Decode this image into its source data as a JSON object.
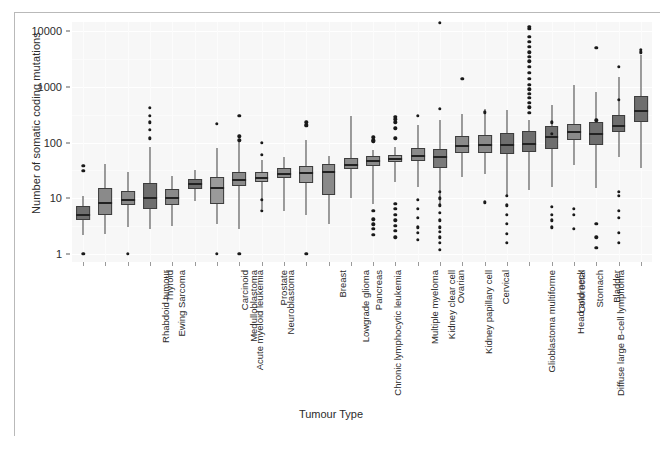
{
  "chart_data": {
    "type": "boxplot",
    "title": "",
    "xlabel": "Tumour Type",
    "ylabel": "Number of somatic coding mutations",
    "yscale": "log10",
    "ylim": [
      0.8,
      20000
    ],
    "yticks": [
      1,
      10,
      100,
      1000,
      10000
    ],
    "ytick_labels": [
      "1",
      "10",
      "100",
      "1000",
      "10000"
    ],
    "grid": true,
    "legend": "none",
    "categories": [
      "Rhabdoid tumour",
      "Ewing Sarcoma",
      "Thyroid",
      "Acute myeloid leukemia",
      "Medulloblastoma",
      "Carcinoid",
      "Neuroblastoma",
      "Prostate",
      "Chronic lymphocytic leukemia",
      "Lowgrade glioma",
      "Breast",
      "Pancreas",
      "Multiple myeloma",
      "Kidney clear cell",
      "Kidney papillary cell",
      "Ovarian",
      "Glioblastoma multiforme",
      "Cervical",
      "Diffuse large B-cell lymphoma",
      "Head and neck",
      "Colorectal",
      "Stomach",
      "Bladder",
      "Lung adenocarcinoma",
      "Lung squamous cell carcinoma",
      "Melanoma"
    ],
    "boxes": [
      {
        "category": "Rhabdoid tumour",
        "fill": "#6e6e6e",
        "lower_whisker": 2.2,
        "q1": 4.0,
        "median": 5.2,
        "q3": 7.2,
        "upper_whisker": 11.0,
        "outliers": [
          1.0,
          31,
          38
        ]
      },
      {
        "category": "Ewing Sarcoma",
        "fill": "#8a8a8a",
        "lower_whisker": 2.3,
        "q1": 5.0,
        "median": 8.5,
        "q3": 15.5,
        "upper_whisker": 41,
        "outliers": []
      },
      {
        "category": "Thyroid",
        "fill": "#8a8a8a",
        "lower_whisker": 3.0,
        "q1": 7.5,
        "median": 9.8,
        "q3": 13.5,
        "upper_whisker": 30,
        "outliers": [
          1.0
        ]
      },
      {
        "category": "Acute myeloid leukemia",
        "fill": "#6e6e6e",
        "lower_whisker": 2.8,
        "q1": 6.5,
        "median": 10.5,
        "q3": 18.5,
        "upper_whisker": 83,
        "outliers": [
          120,
          170,
          230,
          300,
          420
        ]
      },
      {
        "category": "Medulloblastoma",
        "fill": "#8a8a8a",
        "lower_whisker": 3.2,
        "q1": 7.5,
        "median": 10.5,
        "q3": 14.5,
        "upper_whisker": 25,
        "outliers": []
      },
      {
        "category": "Carcinoid",
        "fill": "#6e6e6e",
        "lower_whisker": 9.0,
        "q1": 14.5,
        "median": 18.5,
        "q3": 22.5,
        "upper_whisker": 32,
        "outliers": []
      },
      {
        "category": "Neuroblastoma",
        "fill": "#9a9a9a",
        "lower_whisker": 3.4,
        "q1": 8.0,
        "median": 16.0,
        "q3": 24.0,
        "upper_whisker": 80,
        "outliers": [
          1.0,
          220
        ]
      },
      {
        "category": "Prostate",
        "fill": "#8a8a8a",
        "lower_whisker": 2.8,
        "q1": 16.5,
        "median": 22.5,
        "q3": 30.0,
        "upper_whisker": 105,
        "outliers": [
          1.0,
          110,
          130,
          300
        ]
      },
      {
        "category": "Chronic lymphocytic leukemia",
        "fill": "#9a9a9a",
        "lower_whisker": 6.5,
        "q1": 19.5,
        "median": 24.5,
        "q3": 30.0,
        "upper_whisker": 48,
        "outliers": [
          6.0,
          9.5,
          60,
          100
        ]
      },
      {
        "category": "Lowgrade glioma",
        "fill": "#8a8a8a",
        "lower_whisker": 6.0,
        "q1": 23.0,
        "median": 28.5,
        "q3": 35.5,
        "upper_whisker": 55,
        "outliers": []
      },
      {
        "category": "Breast",
        "fill": "#9a9a9a",
        "lower_whisker": 5.0,
        "q1": 19.0,
        "median": 30.0,
        "q3": 38.0,
        "upper_whisker": 110,
        "outliers": [
          1.0,
          200,
          210,
          230
        ]
      },
      {
        "category": "Pancreas",
        "fill": "#8a8a8a",
        "lower_whisker": 3.5,
        "q1": 11.5,
        "median": 31.0,
        "q3": 42.0,
        "upper_whisker": 58,
        "outliers": []
      },
      {
        "category": "Multiple myeloma",
        "fill": "#8a8a8a",
        "lower_whisker": 10.0,
        "q1": 33.0,
        "median": 42.0,
        "q3": 52.0,
        "upper_whisker": 300,
        "outliers": []
      },
      {
        "category": "Kidney clear cell",
        "fill": "#8a8a8a",
        "lower_whisker": 8.0,
        "q1": 38.0,
        "median": 48.0,
        "q3": 58.0,
        "upper_whisker": 75,
        "outliers": [
          2.2,
          2.8,
          3.4,
          4.2,
          6.0,
          105,
          110,
          125
        ]
      },
      {
        "category": "Kidney papillary cell",
        "fill": "#9a9a9a",
        "lower_whisker": 20.0,
        "q1": 44.0,
        "median": 52.0,
        "q3": 60.0,
        "upper_whisker": 85,
        "outliers": [
          2.0,
          2.6,
          3.2,
          4.0,
          5.0,
          6.5,
          8.0,
          120,
          180,
          230,
          260,
          290
        ]
      },
      {
        "category": "Ovarian",
        "fill": "#8a8a8a",
        "lower_whisker": 16.0,
        "q1": 47.0,
        "median": 60.0,
        "q3": 80.0,
        "upper_whisker": 210,
        "outliers": [
          1.8,
          2.4,
          3.0,
          4.5,
          6.5,
          9.5,
          300
        ]
      },
      {
        "category": "Glioblastoma multiforme",
        "fill": "#7a7a7a",
        "lower_whisker": 7.0,
        "q1": 35.0,
        "median": 58.0,
        "q3": 78.0,
        "upper_whisker": 250,
        "outliers": [
          1.2,
          1.6,
          2.0,
          2.5,
          3.0,
          4.0,
          5.5,
          7.5,
          10.0,
          13.0,
          400,
          14000
        ]
      },
      {
        "category": "Cervical",
        "fill": "#8a8a8a",
        "lower_whisker": 24.0,
        "q1": 64.0,
        "median": 90.0,
        "q3": 130.0,
        "upper_whisker": 330,
        "outliers": [
          1400
        ]
      },
      {
        "category": "Diffuse large B-cell lymphoma",
        "fill": "#8a8a8a",
        "lower_whisker": 27.0,
        "q1": 66.0,
        "median": 95.0,
        "q3": 135.0,
        "upper_whisker": 400,
        "outliers": [
          8.5,
          350
        ]
      },
      {
        "category": "Head and neck",
        "fill": "#6e6e6e",
        "lower_whisker": 11.0,
        "q1": 62.0,
        "median": 95.0,
        "q3": 150.0,
        "upper_whisker": 380,
        "outliers": [
          1.6,
          2.3,
          3.5,
          5.0,
          7.5,
          11.0
        ]
      },
      {
        "category": "Colorectal",
        "fill": "#6e6e6e",
        "lower_whisker": 14.0,
        "q1": 68.0,
        "median": 100.0,
        "q3": 160.0,
        "upper_whisker": 250,
        "outliers": [
          340,
          430,
          520,
          640,
          760,
          900,
          1100,
          1400,
          1800,
          2300,
          2900,
          3500,
          4200,
          5200,
          6500,
          8000,
          11000,
          12000
        ]
      },
      {
        "category": "Stomach",
        "fill": "#6e6e6e",
        "lower_whisker": 16.0,
        "q1": 78.0,
        "median": 130.0,
        "q3": 195.0,
        "upper_whisker": 480,
        "outliers": [
          3.0,
          4.0,
          5.0,
          7.0,
          145,
          230
        ]
      },
      {
        "category": "Bladder",
        "fill": "#8a8a8a",
        "lower_whisker": 40.0,
        "q1": 110.0,
        "median": 160.0,
        "q3": 215.0,
        "upper_whisker": 1100,
        "outliers": [
          5.0,
          6.5,
          2.8
        ]
      },
      {
        "category": "Lung adenocarcinoma",
        "fill": "#6e6e6e",
        "lower_whisker": 15.0,
        "q1": 90.0,
        "median": 150.0,
        "q3": 230.0,
        "upper_whisker": 800,
        "outliers": [
          1.3,
          2.0,
          3.5,
          250,
          5000
        ]
      },
      {
        "category": "Lung squamous cell carcinoma",
        "fill": "#6e6e6e",
        "lower_whisker": 55.0,
        "q1": 155.0,
        "median": 210.0,
        "q3": 310.0,
        "upper_whisker": 1500,
        "outliers": [
          1.6,
          2.4,
          4.5,
          6.0,
          11.0,
          13.0,
          580,
          2300
        ]
      },
      {
        "category": "Melanoma",
        "fill": "#6e6e6e",
        "lower_whisker": 35.0,
        "q1": 230.0,
        "median": 380.0,
        "q3": 700.0,
        "upper_whisker": 3800,
        "outliers": [
          4200,
          4600
        ]
      }
    ]
  },
  "colors": {
    "panel_background": "#f7f7f7",
    "grid_line": "#ffffff",
    "box_stroke": "#3d3d3d",
    "median": "#222222",
    "outlier": "#1a1a1a",
    "text": "#2b2b2b"
  }
}
